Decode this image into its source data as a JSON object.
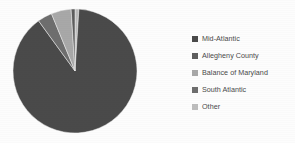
{
  "chart_data": {
    "type": "pie",
    "title": "",
    "legend_position": "right",
    "labels": [
      "Mid-Atlantic",
      "Allegheny County",
      "Balance of Maryland",
      "South Atlantic",
      "Other"
    ],
    "values": [
      89.0,
      1.0,
      5.2,
      3.8,
      1.0
    ],
    "unit": "percent",
    "colors": [
      "#4a4a4a",
      "#5e5e5e",
      "#a8a8a8",
      "#6e6e6e",
      "#bdbdbd"
    ],
    "start_angle_deg": 0,
    "direction": "clockwise",
    "slices": [
      {
        "label": "Other",
        "value": 1.0,
        "color": "#bdbdbd"
      },
      {
        "label": "Mid-Atlantic",
        "value": 89.0,
        "color": "#4a4a4a"
      },
      {
        "label": "South Atlantic",
        "value": 3.8,
        "color": "#6e6e6e"
      },
      {
        "label": "Balance of Maryland",
        "value": 5.2,
        "color": "#a8a8a8"
      },
      {
        "label": "Allegheny County",
        "value": 1.0,
        "color": "#5e5e5e"
      }
    ]
  },
  "legend": {
    "items": [
      {
        "label": "Mid-Atlantic",
        "color": "#4a4a4a"
      },
      {
        "label": "Allegheny County",
        "color": "#5e5e5e"
      },
      {
        "label": "Balance of Maryland",
        "color": "#a8a8a8"
      },
      {
        "label": "South Atlantic",
        "color": "#6e6e6e"
      },
      {
        "label": "Other",
        "color": "#bdbdbd"
      }
    ]
  },
  "figure": {
    "background": "#fdfdfd",
    "pie_center_x": 63,
    "pie_center_y": 63,
    "pie_radius": 62
  }
}
